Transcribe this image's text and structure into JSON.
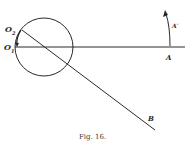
{
  "figure": {
    "caption": "Fig. 16.",
    "labels": {
      "o2": "O",
      "o2_sub": "2",
      "o1": "O",
      "o1_sub": "1",
      "a": "A",
      "a_prime": "A′",
      "b": "B"
    },
    "stroke_color": "#2a2a2a"
  }
}
